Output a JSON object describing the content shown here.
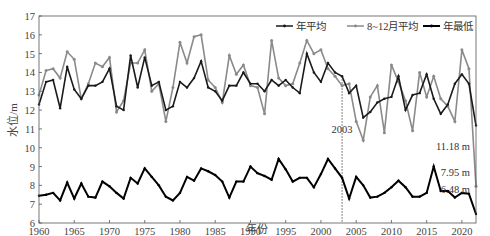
{
  "chart_data": {
    "type": "line",
    "title": "",
    "xlabel": "年份",
    "ylabel": "水位/m",
    "xlim": [
      1960,
      2022
    ],
    "ylim": [
      6,
      17
    ],
    "xticks": [
      1960,
      1965,
      1970,
      1975,
      1980,
      1985,
      1990,
      1995,
      2000,
      2005,
      2010,
      2015,
      2020
    ],
    "yticks": [
      6,
      7,
      8,
      9,
      10,
      11,
      12,
      13,
      14,
      15,
      16,
      17
    ],
    "legend": [
      "年平均",
      "8~12月平均",
      "年最低"
    ],
    "legend_position": "top-right",
    "x": [
      1960,
      1961,
      1962,
      1963,
      1964,
      1965,
      1966,
      1967,
      1968,
      1969,
      1970,
      1971,
      1972,
      1973,
      1974,
      1975,
      1976,
      1977,
      1978,
      1979,
      1980,
      1981,
      1982,
      1983,
      1984,
      1985,
      1986,
      1987,
      1988,
      1989,
      1990,
      1991,
      1992,
      1993,
      1994,
      1995,
      1996,
      1997,
      1998,
      1999,
      2000,
      2001,
      2002,
      2003,
      2004,
      2005,
      2006,
      2007,
      2008,
      2009,
      2010,
      2011,
      2012,
      2013,
      2014,
      2015,
      2016,
      2017,
      2018,
      2019,
      2020,
      2021,
      2022
    ],
    "series": [
      {
        "name": "年平均",
        "color": "#1a1a1a",
        "values": [
          12.3,
          13.5,
          13.6,
          12.1,
          14.3,
          13.1,
          12.6,
          13.3,
          13.3,
          13.5,
          14.2,
          12.2,
          12.0,
          14.9,
          13.2,
          14.8,
          13.3,
          13.5,
          12.0,
          12.2,
          13.5,
          13.2,
          13.7,
          14.6,
          13.2,
          13.0,
          12.5,
          13.3,
          13.3,
          14.0,
          13.4,
          13.4,
          13.0,
          13.6,
          13.3,
          13.6,
          13.2,
          12.9,
          15.0,
          14.0,
          13.5,
          14.5,
          14.0,
          13.8,
          12.9,
          13.3,
          11.6,
          11.9,
          12.4,
          12.6,
          12.7,
          13.8,
          12.0,
          12.8,
          12.9,
          13.9,
          12.6,
          11.8,
          12.3,
          13.4,
          13.9,
          13.4,
          11.18
        ]
      },
      {
        "name": "8~12月平均",
        "color": "#8a8a8a",
        "values": [
          12.8,
          14.1,
          14.2,
          13.7,
          15.1,
          14.7,
          12.6,
          13.4,
          14.5,
          14.3,
          14.8,
          11.9,
          12.5,
          14.5,
          14.5,
          15.2,
          13.0,
          13.4,
          11.4,
          13.2,
          15.6,
          14.5,
          15.9,
          16.0,
          13.6,
          13.2,
          12.4,
          14.9,
          13.9,
          14.4,
          13.3,
          13.2,
          11.8,
          15.7,
          13.7,
          13.3,
          13.4,
          14.5,
          15.7,
          15.0,
          15.2,
          14.2,
          13.8,
          13.3,
          13.4,
          11.4,
          10.4,
          12.7,
          13.3,
          10.8,
          14.4,
          13.5,
          12.5,
          10.9,
          14.0,
          12.7,
          13.8,
          12.6,
          12.2,
          11.4,
          15.2,
          14.2,
          7.95
        ]
      },
      {
        "name": "年最低",
        "color": "#000000",
        "values": [
          7.45,
          7.5,
          7.6,
          7.2,
          8.15,
          7.3,
          8.1,
          7.4,
          7.35,
          8.2,
          7.95,
          7.6,
          7.3,
          8.4,
          8.1,
          8.9,
          8.45,
          8.0,
          7.4,
          7.2,
          7.6,
          8.45,
          8.25,
          8.9,
          8.75,
          8.55,
          8.2,
          7.35,
          8.2,
          8.2,
          9.0,
          8.65,
          8.5,
          8.3,
          9.4,
          8.85,
          8.2,
          8.4,
          8.4,
          7.9,
          8.6,
          9.4,
          8.9,
          8.4,
          7.3,
          8.45,
          8.0,
          7.35,
          7.4,
          7.6,
          7.9,
          8.25,
          7.9,
          7.4,
          7.4,
          7.6,
          9.0,
          7.7,
          7.7,
          7.35,
          7.6,
          7.55,
          6.48
        ]
      }
    ],
    "annotations": [
      {
        "text": "2003",
        "x": 2003,
        "type": "vertical-dashed-line"
      },
      {
        "text": "11.18 m",
        "series": "年平均",
        "x": 2022
      },
      {
        "text": "7.95 m",
        "series": "8~12月平均",
        "x": 2022
      },
      {
        "text": "6.48 m",
        "series": "年最低",
        "x": 2022
      }
    ],
    "grid": false
  }
}
